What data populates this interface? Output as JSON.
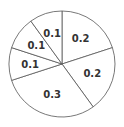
{
  "chart_data": {
    "type": "pie",
    "title": "",
    "categories": [
      "A",
      "B",
      "C",
      "D",
      "E",
      "F"
    ],
    "values": [
      0.2,
      0.2,
      0.3,
      0.1,
      0.1,
      0.1
    ],
    "labels": [
      "0.2",
      "0.2",
      "0.3",
      "0.1",
      "0.1",
      "0.1"
    ],
    "legend": "none",
    "start_angle_deg": 90,
    "direction": "clockwise",
    "colors": {
      "fill": "#ffffff",
      "stroke": "#555555",
      "text": "#333333"
    }
  }
}
